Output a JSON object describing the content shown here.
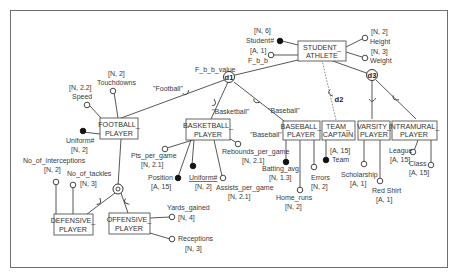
{
  "diagram": {
    "entities": {
      "student_athlete": [
        "STUDENT_",
        "ATHLETE"
      ],
      "football_player": [
        "FOOTBALL_",
        "PLAYER"
      ],
      "basketball_player": [
        "BASKETBALL_",
        "PLAYER"
      ],
      "baseball_player": [
        "BASEBALL_",
        "PLAYER"
      ],
      "team_captain": [
        "TEAM_",
        "CAPTAIN"
      ],
      "varsity_player": [
        "VARSITY_",
        "PLAYER"
      ],
      "intramural_player": [
        "INTRAMURAL_",
        "PLAYER"
      ],
      "defensive_player": [
        "DEFENSIVE_",
        "PLAYER"
      ],
      "offensive_player": [
        "OFFENSIVE_",
        "PLAYER"
      ]
    },
    "specializations": {
      "d1": {
        "label": "d1",
        "defining_attribute": "F_b_b_value"
      },
      "d2": {
        "label": "d2"
      },
      "d3": {
        "label": "d3"
      },
      "o": {
        "label": "o"
      }
    },
    "predicates": {
      "football": "\"Football\"",
      "basketball": "\"Basketball\"",
      "baseball1": "\"Baseball\"",
      "baseball2": "\"Baseball\""
    },
    "attributes": {
      "student_num": {
        "name": "Student#",
        "domain": "[N, 6]",
        "key": true
      },
      "f_b_b": {
        "name": "F_b_b",
        "domain": "[A, 1]",
        "key": false
      },
      "height": {
        "name": "Height",
        "domain": "[N, 2]",
        "key": false
      },
      "weight": {
        "name": "Weight",
        "domain": "[N, 3]",
        "key": false
      },
      "speed": {
        "name": "Speed",
        "domain": "[N, 2.2]",
        "key": false
      },
      "touchdowns": {
        "name": "Touchdowns",
        "domain": "[N, 2]",
        "key": false
      },
      "fb_uniform": {
        "name": "Uniform#",
        "domain": "[N,  2]",
        "key": true
      },
      "pts_per_game": {
        "name": "Pts_per_game",
        "domain": "[N, 2.1]",
        "key": false
      },
      "position": {
        "name": "Position",
        "domain": "[A, 15]",
        "key": true
      },
      "bb_uniform": {
        "name": "Uniform#",
        "domain": "[N, 2]",
        "key": true
      },
      "assists_per_game": {
        "name": "Assists_per_game",
        "domain": "[N, 2.1]",
        "key": false
      },
      "rebounds_per_game": {
        "name": "Rebounds_per_game",
        "domain": "[N, 2.1]",
        "key": false
      },
      "batting_avg": {
        "name": "Batting_avg",
        "domain": "[N, 1.3]",
        "key": true
      },
      "home_runs": {
        "name": "Home_runs",
        "domain": "[N, 2]",
        "key": false
      },
      "errors": {
        "name": "Errors",
        "domain": "[N, 2]",
        "key": false
      },
      "team": {
        "name": "Team",
        "domain": "[A, 15]",
        "key": true
      },
      "scholarship": {
        "name": "Scholarship",
        "domain": "[A, 1]",
        "key": false
      },
      "red_shirt": {
        "name": "Red Shirt",
        "domain": "[A, 1]",
        "key": false
      },
      "league": {
        "name": "League",
        "domain": "[A, 15]",
        "key": false
      },
      "class": {
        "name": "Class",
        "domain": "[A, 15]",
        "key": false
      },
      "no_of_interceptions": {
        "name": "No_of_interceptions",
        "domain": "[N, 2]",
        "key": false
      },
      "no_of_tackles": {
        "name": "No_of_tackles",
        "domain": "[N, 3]",
        "key": false
      },
      "yards_gained": {
        "name": "Yards_gained",
        "domain": "[N, 4]",
        "key": false
      },
      "receptions": {
        "name": "Receptions",
        "domain": "[N, 3]",
        "key": false
      }
    }
  }
}
